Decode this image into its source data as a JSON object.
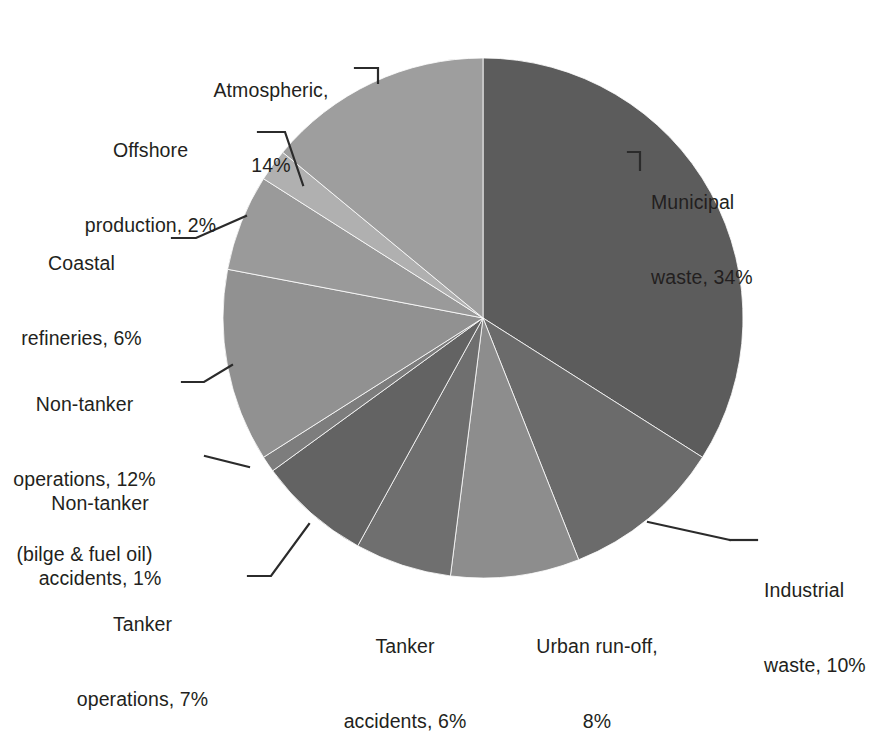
{
  "figure": {
    "title": "",
    "background_color": "#ffffff",
    "text_color": "#231f20",
    "leader_line_color": "#2b2b2b"
  },
  "chart_data": {
    "type": "pie",
    "title": "",
    "xlabel": "",
    "ylabel": "",
    "start_angle_deg": 0,
    "direction": "clockwise",
    "units": "percent",
    "total": 100,
    "legend_position": "none",
    "grid": false,
    "labels_outside": true,
    "categories": [
      "Municipal waste",
      "Industrial waste",
      "Urban run-off",
      "Tanker accidents",
      "Tanker operations",
      "Non-tanker accidents",
      "Non-tanker operations (bilge & fuel oil)",
      "Coastal refineries",
      "Offshore production",
      "Atmospheric"
    ],
    "values": [
      34,
      10,
      8,
      6,
      7,
      1,
      12,
      6,
      2,
      14
    ],
    "colors": [
      "#5c5c5c",
      "#6b6b6b",
      "#8d8d8d",
      "#6f6f6f",
      "#636363",
      "#7d7d7d",
      "#919191",
      "#9a9a9a",
      "#b0b0b0",
      "#9e9e9e"
    ],
    "slice_labels": [
      "Municipal waste, 34%",
      "Industrial waste, 10%",
      "Urban run-off, 8%",
      "Tanker accidents, 6%",
      "Tanker operations, 7%",
      "Non-tanker accidents, 1%",
      "Non-tanker operations, 12% (bilge & fuel oil)",
      "Coastal refineries, 6%",
      "Offshore production, 2%",
      "Atmospheric, 14%"
    ]
  },
  "labels": {
    "municipal": {
      "line1": "Municipal",
      "line2": "waste, 34%"
    },
    "industrial": {
      "line1": "Industrial",
      "line2": "waste, 10%"
    },
    "urban_runoff": {
      "line1": "Urban run-off,",
      "line2": "8%"
    },
    "tanker_accidents": {
      "line1": "Tanker",
      "line2": "accidents, 6%"
    },
    "tanker_operations": {
      "line1": "Tanker",
      "line2": "operations, 7%"
    },
    "non_tanker_accidents": {
      "line1": "Non-tanker",
      "line2": "accidents, 1%"
    },
    "non_tanker_operations": {
      "line1": "Non-tanker",
      "line2": "operations, 12%",
      "line3": "(bilge & fuel oil)"
    },
    "coastal_refineries": {
      "line1": "Coastal",
      "line2": "refineries, 6%"
    },
    "offshore_production": {
      "line1": "Offshore",
      "line2": "production, 2%"
    },
    "atmospheric": {
      "line1": "Atmospheric,",
      "line2": "14%"
    }
  }
}
